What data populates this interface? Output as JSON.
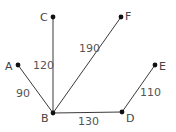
{
  "diagram": {
    "type": "weighted-graph",
    "nodes": [
      {
        "id": "A",
        "label": "A",
        "x": 18,
        "y": 65,
        "lx": 5,
        "ly": 70
      },
      {
        "id": "B",
        "label": "B",
        "x": 53,
        "y": 113,
        "lx": 41,
        "ly": 122
      },
      {
        "id": "C",
        "label": "C",
        "x": 53,
        "y": 17,
        "lx": 40,
        "ly": 21
      },
      {
        "id": "D",
        "label": "D",
        "x": 122,
        "y": 112,
        "lx": 126,
        "ly": 122
      },
      {
        "id": "E",
        "label": "E",
        "x": 155,
        "y": 65,
        "lx": 159,
        "ly": 70
      },
      {
        "id": "F",
        "label": "F",
        "x": 121,
        "y": 17,
        "lx": 125,
        "ly": 20
      }
    ],
    "edges": [
      {
        "from": "A",
        "to": "B",
        "weight": "90",
        "wx": 16,
        "wy": 97
      },
      {
        "from": "C",
        "to": "B",
        "weight": "120",
        "wx": 33,
        "wy": 69
      },
      {
        "from": "F",
        "to": "B",
        "weight": "190",
        "wx": 79,
        "wy": 52
      },
      {
        "from": "B",
        "to": "D",
        "weight": "130",
        "wx": 78,
        "wy": 125
      },
      {
        "from": "D",
        "to": "E",
        "weight": "110",
        "wx": 140,
        "wy": 96
      }
    ]
  }
}
